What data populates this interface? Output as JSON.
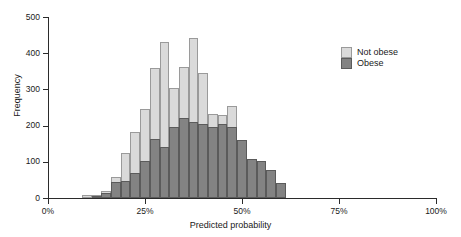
{
  "chart_data": {
    "type": "bar",
    "subtype": "overlaid-histogram",
    "title": "",
    "xlabel": "Predicted probability",
    "ylabel": "Frequency",
    "xlim": [
      0,
      100
    ],
    "ylim": [
      0,
      500
    ],
    "grid": false,
    "legend_position": "upper-right",
    "x_unit": "percent",
    "bin_width": 2.5,
    "bin_starts": [
      8.75,
      11.25,
      13.75,
      16.25,
      18.75,
      21.25,
      23.75,
      26.25,
      28.75,
      31.25,
      33.75,
      36.25,
      38.75,
      41.25,
      43.75,
      46.25,
      48.75,
      51.25,
      53.75,
      56.25,
      58.75
    ],
    "x_tick_values": [
      0,
      25,
      50,
      75,
      100
    ],
    "x_tick_labels": [
      "0%",
      "25%",
      "50%",
      "75%",
      "100%"
    ],
    "y_tick_values": [
      0,
      100,
      200,
      300,
      400,
      500
    ],
    "y_tick_labels": [
      "0",
      "100",
      "200",
      "300",
      "400",
      "500"
    ],
    "series": [
      {
        "name": "Not obese",
        "color": "#dadada",
        "edge_color": "#9a9a9a",
        "values": [
          9,
          7,
          18,
          58,
          124,
          182,
          247,
          360,
          430,
          303,
          363,
          443,
          345,
          232,
          228,
          255,
          107,
          101,
          78,
          42,
          0
        ]
      },
      {
        "name": "Obese",
        "color": "#838383",
        "edge_color": "#5b5b5b",
        "values": [
          0,
          6,
          15,
          43,
          47,
          69,
          102,
          162,
          140,
          196,
          220,
          210,
          204,
          196,
          205,
          197,
          160,
          108,
          101,
          78,
          42
        ]
      }
    ]
  },
  "axes": {
    "x_title": "Predicted probability",
    "y_title": "Frequency"
  },
  "legend": {
    "items": [
      {
        "label": "Not obese",
        "swatch": "light"
      },
      {
        "label": "Obese",
        "swatch": "dark"
      }
    ]
  }
}
